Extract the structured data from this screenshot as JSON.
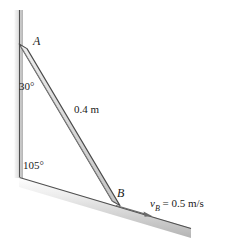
{
  "figure": {
    "background_color": "#ffffff",
    "width": 225,
    "height": 239
  },
  "labels": {
    "point_a": "A",
    "point_b": "B",
    "angle_top": "30°",
    "angle_bottom": "105°",
    "rod_length": "0.4 m",
    "velocity_symbol": "v",
    "velocity_subscript": "B",
    "velocity_value": "= 0.5 m/s"
  },
  "geometry": {
    "wall": {
      "name": "vertical-wall",
      "top": [
        19,
        10
      ],
      "bottom": [
        20,
        178
      ],
      "band_color_light": "#f2f2f2",
      "band_color_dark": "#b8b8b8",
      "line_color": "#5a5a5a"
    },
    "ground": {
      "name": "inclined-ground",
      "start": [
        20,
        178
      ],
      "end": [
        191,
        229
      ],
      "band_color_light": "#f4f4f4",
      "band_color_dark": "#b0b0b0",
      "line_color": "#5a5a5a"
    },
    "rod": {
      "name": "rod-ab",
      "end_a": [
        23,
        47
      ],
      "end_b": [
        116,
        204
      ],
      "fill_color": "#d9d9d9",
      "edge_color": "#4d4d4d",
      "thickness": 8
    },
    "velocity_arrow": {
      "name": "velocity-arrow",
      "start": [
        116,
        205
      ],
      "end": [
        152,
        216
      ],
      "color": "#6b6b6b"
    }
  },
  "colors": {
    "text": "#1a1a1a",
    "outline": "#5a5a5a",
    "shade_light": "#f2f2f2",
    "shade_mid": "#d9d9d9",
    "shade_dark": "#a8a8a8"
  }
}
